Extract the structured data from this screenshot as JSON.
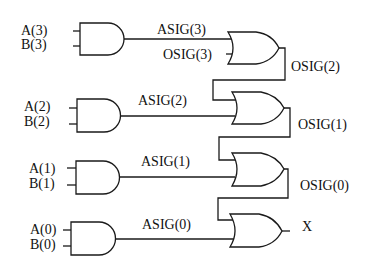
{
  "diagram": {
    "type": "logic-circuit",
    "inputs": [
      {
        "a": "A(3)",
        "b": "B(3)"
      },
      {
        "a": "A(2)",
        "b": "B(2)"
      },
      {
        "a": "A(1)",
        "b": "B(1)"
      },
      {
        "a": "A(0)",
        "b": "B(0)"
      }
    ],
    "and_outputs": [
      "ASIG(3)",
      "ASIG(2)",
      "ASIG(1)",
      "ASIG(0)"
    ],
    "or_inputs_top": "OSIG(3)",
    "or_outputs": [
      "OSIG(2)",
      "OSIG(1)",
      "OSIG(0)"
    ],
    "final_output": "X",
    "gates": {
      "and": [
        "AND gate 3",
        "AND gate 2",
        "AND gate 1",
        "AND gate 0"
      ],
      "or": [
        "OR gate 3",
        "OR gate 2",
        "OR gate 1",
        "OR gate 0"
      ]
    }
  }
}
